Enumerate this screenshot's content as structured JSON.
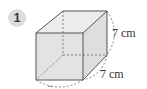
{
  "problem": {
    "number": "1",
    "shape": "cube",
    "labels": {
      "height": "7 cm",
      "depth": "7 cm",
      "width": "–"
    }
  },
  "colors": {
    "face_fill": "#e3e3e3",
    "edge": "#555555",
    "badge": "#dcdcdc"
  }
}
